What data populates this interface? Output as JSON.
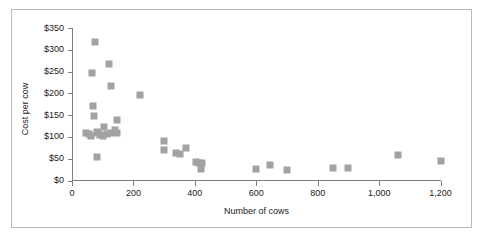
{
  "chart_data": {
    "type": "scatter",
    "title": "",
    "xlabel": "Number of cows",
    "ylabel": "Cost per cow",
    "xlim": [
      0,
      1200
    ],
    "ylim": [
      0,
      350
    ],
    "xticks": [
      0,
      200,
      400,
      600,
      800,
      1000,
      1200
    ],
    "xtick_labels": [
      "0",
      "200",
      "400",
      "600",
      "800",
      "1,000",
      "1,200"
    ],
    "yticks": [
      0,
      50,
      100,
      150,
      200,
      250,
      300,
      350
    ],
    "ytick_labels": [
      "$0",
      "$50",
      "$100",
      "$150",
      "$200",
      "$250",
      "$300",
      "$350"
    ],
    "grid": false,
    "legend": null,
    "marker": {
      "shape": "square",
      "color": "#a2a2a2",
      "size_px": 7
    },
    "axis_color": "#7d7d7d",
    "frame_color": "#b9b9b9",
    "background": "#ffffff",
    "points": [
      {
        "x": 75,
        "y": 317
      },
      {
        "x": 120,
        "y": 268
      },
      {
        "x": 65,
        "y": 246
      },
      {
        "x": 128,
        "y": 216
      },
      {
        "x": 220,
        "y": 196
      },
      {
        "x": 68,
        "y": 172
      },
      {
        "x": 70,
        "y": 147
      },
      {
        "x": 148,
        "y": 140
      },
      {
        "x": 105,
        "y": 122
      },
      {
        "x": 140,
        "y": 115
      },
      {
        "x": 145,
        "y": 110
      },
      {
        "x": 45,
        "y": 108
      },
      {
        "x": 55,
        "y": 106
      },
      {
        "x": 62,
        "y": 103
      },
      {
        "x": 80,
        "y": 112
      },
      {
        "x": 85,
        "y": 108
      },
      {
        "x": 92,
        "y": 104
      },
      {
        "x": 100,
        "y": 103
      },
      {
        "x": 115,
        "y": 107
      },
      {
        "x": 128,
        "y": 110
      },
      {
        "x": 80,
        "y": 55
      },
      {
        "x": 298,
        "y": 90
      },
      {
        "x": 300,
        "y": 70
      },
      {
        "x": 340,
        "y": 63
      },
      {
        "x": 352,
        "y": 60
      },
      {
        "x": 372,
        "y": 74
      },
      {
        "x": 405,
        "y": 43
      },
      {
        "x": 415,
        "y": 41
      },
      {
        "x": 422,
        "y": 40
      },
      {
        "x": 420,
        "y": 27
      },
      {
        "x": 600,
        "y": 27
      },
      {
        "x": 645,
        "y": 35
      },
      {
        "x": 700,
        "y": 24
      },
      {
        "x": 850,
        "y": 29
      },
      {
        "x": 900,
        "y": 28
      },
      {
        "x": 1060,
        "y": 58
      },
      {
        "x": 1200,
        "y": 45
      }
    ]
  }
}
